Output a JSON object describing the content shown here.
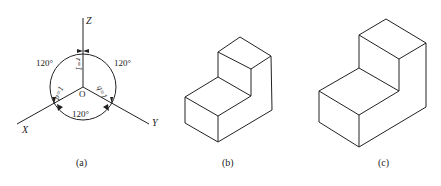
{
  "figure_a": {
    "axes": {
      "z": "Z",
      "x": "X",
      "y": "Y",
      "origin": "O"
    },
    "angles": [
      "120°",
      "120°",
      "120°"
    ],
    "coefficients": {
      "p": "p=1",
      "q": "q=1",
      "r": "r=1"
    },
    "caption": "(a)"
  },
  "figure_b": {
    "caption": "(b)",
    "description": "isometric drawing of L-shaped block (simplified coefficients)"
  },
  "figure_c": {
    "caption": "(c)",
    "description": "isometric drawing of L-shaped block (enlarged)"
  },
  "colors": {
    "line": "#222222",
    "background": "#ffffff"
  }
}
